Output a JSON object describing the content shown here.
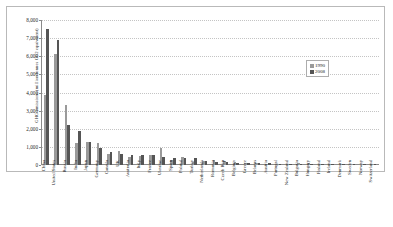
{
  "chart_data": {
    "type": "bar",
    "title": "",
    "xlabel": "",
    "ylabel": "GHG emissions (million tonnes CO2 equivalent)",
    "ylim": [
      0,
      8000
    ],
    "yticks": [
      0,
      1000,
      2000,
      3000,
      4000,
      5000,
      6000,
      7000,
      8000
    ],
    "ytick_labels": [
      "0",
      "1,000",
      "2,000",
      "3,000",
      "4,000",
      "5,000",
      "6,000",
      "7,000",
      "8,000"
    ],
    "grid": true,
    "legend_position": "top-right",
    "categories": [
      "China",
      "United States",
      "Russia",
      "India",
      "Japan",
      "Germany",
      "Canada",
      "UK",
      "Australia",
      "Italy",
      "France",
      "Ukraine",
      "Spain",
      "Poland",
      "Turkey",
      "Netherlands",
      "Romania",
      "Czech Rep",
      "Belgium",
      "Greece",
      "Belarus",
      "Austria",
      "Portugal",
      "New Zealand",
      "Bulgaria",
      "Hungary",
      "Finland",
      "Ireland",
      "Denmark",
      "Sweden",
      "Norway",
      "Switzerland"
    ],
    "series": [
      {
        "name": "1990",
        "color": "#9a9a9a",
        "values": [
          3870,
          6120,
          3320,
          1220,
          1270,
          1230,
          590,
          770,
          420,
          520,
          560,
          930,
          290,
          460,
          190,
          215,
          260,
          195,
          145,
          105,
          130,
          80,
          60,
          60,
          130,
          100,
          71,
          55,
          69,
          72,
          50,
          53
        ]
      },
      {
        "name": "2008",
        "color": "#555555",
        "values": [
          7500,
          6900,
          2200,
          1900,
          1280,
          960,
          740,
          620,
          550,
          540,
          530,
          420,
          410,
          400,
          370,
          205,
          145,
          142,
          134,
          126,
          90,
          87,
          78,
          75,
          73,
          73,
          70,
          68,
          64,
          63,
          54,
          50
        ]
      }
    ]
  },
  "legend": {
    "items": [
      {
        "label": "1990",
        "color": "#9a9a9a"
      },
      {
        "label": "2008",
        "color": "#555555"
      }
    ]
  }
}
